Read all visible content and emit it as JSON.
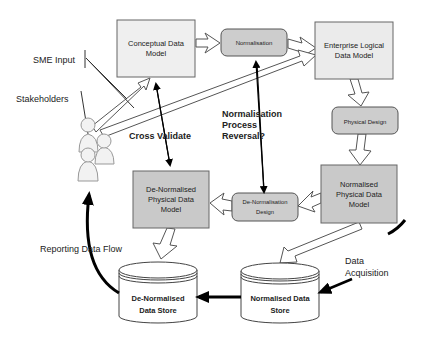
{
  "diagram": {
    "nodes": {
      "conceptual": {
        "line1": "Conceptual Data",
        "line2": "Model"
      },
      "normalisation": {
        "label": "Normalisation"
      },
      "enterprise": {
        "line1": "Enterprise Logical",
        "line2": "Data Model"
      },
      "physical_design": {
        "label": "Physical Design"
      },
      "normalised_physical": {
        "line1": "Normalised",
        "line2": "Physical Data",
        "line3": "Model"
      },
      "denormalisation_design": {
        "line1": "De-Normalisation",
        "line2": "Design"
      },
      "denormalised_physical": {
        "line1": "De-Normalised",
        "line2": "Physical Data",
        "line3": "Model"
      },
      "denormalised_store": {
        "line1": "De-Normalised",
        "line2": "Data Store"
      },
      "normalised_store": {
        "line1": "Normalised Data",
        "line2": "Store"
      }
    },
    "annotations": {
      "sme_input": "SME Input",
      "stakeholders": "Stakeholders",
      "cross_validate": "Cross Validate",
      "reversal_line1": "Normalisation",
      "reversal_line2": "Process",
      "reversal_line3": "Reversal?",
      "reporting_flow": "Reporting Data Flow",
      "acquisition_line1": "Data",
      "acquisition_line2": "Acquisition"
    },
    "colors": {
      "light_box": "#eeeeee",
      "dark_box": "#c9c9c9",
      "process_box": "#cccccc",
      "stroke": "#555555",
      "arrow": "#000000"
    }
  }
}
